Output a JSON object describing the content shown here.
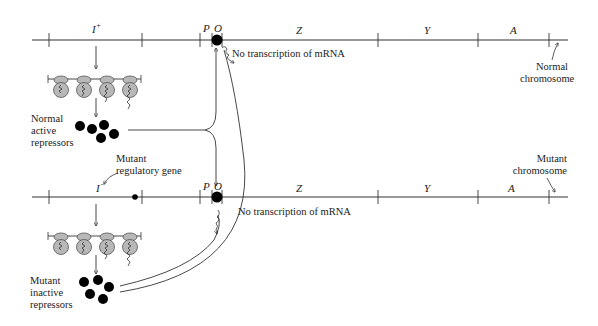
{
  "normal_chromosome": {
    "regulator_label": "I",
    "regulator_sup": "+",
    "promoter_label": "P",
    "operator_label": "O",
    "genes": [
      "Z",
      "Y",
      "A"
    ],
    "no_transcription": "No transcription of mRNA",
    "chromosome_label_line1": "Normal",
    "chromosome_label_line2": "chromosome"
  },
  "normal_repressors": {
    "line1": "Normal",
    "line2": "active",
    "line3": "repressors"
  },
  "mutant_gene_note": {
    "line1": "Mutant",
    "line2": "regulatory gene"
  },
  "mutant_chromosome": {
    "regulator_label": "I",
    "regulator_sup": "−",
    "promoter_label": "P",
    "operator_label": "O",
    "genes": [
      "Z",
      "Y",
      "A"
    ],
    "no_transcription": "No transcription of mRNA",
    "chromosome_label_line1": "Mutant",
    "chromosome_label_line2": "chromosome"
  },
  "mutant_repressors": {
    "line1": "Mutant",
    "line2": "inactive",
    "line3": "repressors"
  },
  "colors": {
    "line": "#333333",
    "ribosome_fill": "#b8b8b8",
    "repressor_fill": "#000000"
  }
}
